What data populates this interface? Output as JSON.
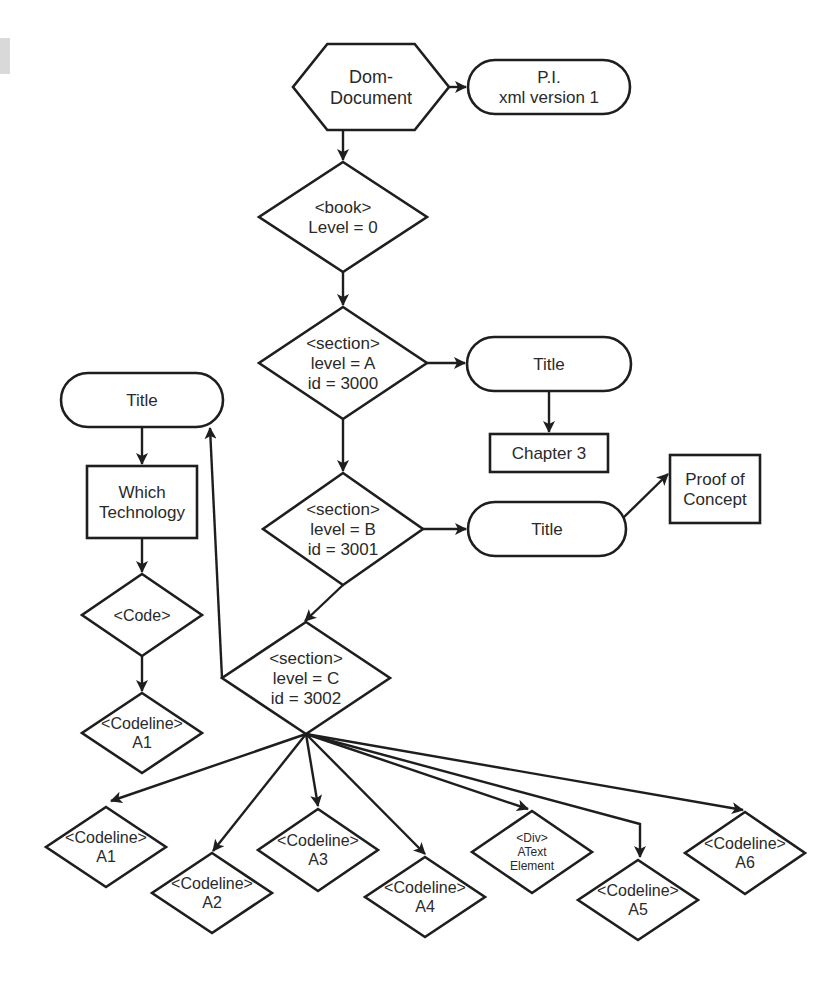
{
  "diagram": {
    "type": "flowchart",
    "colors": {
      "stroke": "#1e1e1e",
      "text": "#2a2a2a",
      "fill": "#ffffff",
      "margin_shade": "#d9d9d9"
    },
    "nodes": [
      {
        "id": "dom",
        "shape": "hexagon",
        "cx": 371,
        "cy": 87,
        "w": 156,
        "h": 86,
        "lines": [
          "Dom-",
          "Document"
        ],
        "size": 18
      },
      {
        "id": "pi",
        "shape": "terminator",
        "cx": 549,
        "cy": 87,
        "w": 162,
        "h": 54,
        "lines": [
          "P.I.",
          "xml version 1"
        ],
        "size": 17
      },
      {
        "id": "book",
        "shape": "diamond",
        "cx": 343,
        "cy": 217,
        "w": 168,
        "h": 110,
        "lines": [
          "<book>",
          "Level = 0"
        ],
        "size": 17
      },
      {
        "id": "secA",
        "shape": "diamond",
        "cx": 343,
        "cy": 363,
        "w": 168,
        "h": 112,
        "lines": [
          "<section>",
          "level = A",
          "id = 3000"
        ],
        "size": 17
      },
      {
        "id": "titleA",
        "shape": "terminator",
        "cx": 549,
        "cy": 364,
        "w": 164,
        "h": 54,
        "lines": [
          "Title"
        ],
        "size": 17
      },
      {
        "id": "chapter3",
        "shape": "rect",
        "cx": 549,
        "cy": 453,
        "w": 118,
        "h": 38,
        "lines": [
          "Chapter 3"
        ],
        "size": 17
      },
      {
        "id": "secB",
        "shape": "diamond",
        "cx": 343,
        "cy": 529,
        "w": 160,
        "h": 112,
        "lines": [
          "<section>",
          "level = B",
          "id = 3001"
        ],
        "size": 17
      },
      {
        "id": "titleB",
        "shape": "terminator",
        "cx": 547,
        "cy": 529,
        "w": 158,
        "h": 54,
        "lines": [
          "Title"
        ],
        "size": 17
      },
      {
        "id": "proof",
        "shape": "rect",
        "cx": 715,
        "cy": 489,
        "w": 90,
        "h": 68,
        "lines": [
          "Proof of",
          "Concept"
        ],
        "size": 17
      },
      {
        "id": "secC",
        "shape": "diamond",
        "cx": 306,
        "cy": 678,
        "w": 168,
        "h": 112,
        "lines": [
          "<section>",
          "level = C",
          "id = 3002"
        ],
        "size": 17
      },
      {
        "id": "titleL",
        "shape": "terminator",
        "cx": 142,
        "cy": 400,
        "w": 162,
        "h": 54,
        "lines": [
          "Title"
        ],
        "size": 17
      },
      {
        "id": "which",
        "shape": "rect",
        "cx": 142,
        "cy": 502,
        "w": 110,
        "h": 72,
        "lines": [
          "Which",
          "Technology"
        ],
        "size": 17
      },
      {
        "id": "code",
        "shape": "diamond",
        "cx": 142,
        "cy": 615,
        "w": 120,
        "h": 82,
        "lines": [
          "<Code>"
        ],
        "size": 16
      },
      {
        "id": "cl_left",
        "shape": "diamond",
        "cx": 142,
        "cy": 733,
        "w": 120,
        "h": 80,
        "lines": [
          "<Codeline>",
          "A1"
        ],
        "size": 16
      },
      {
        "id": "cl_a1",
        "shape": "diamond",
        "cx": 106,
        "cy": 847,
        "w": 120,
        "h": 80,
        "lines": [
          "<Codeline>",
          "A1"
        ],
        "size": 16
      },
      {
        "id": "cl_a2",
        "shape": "diamond",
        "cx": 212,
        "cy": 893,
        "w": 120,
        "h": 80,
        "lines": [
          "<Codeline>",
          "A2"
        ],
        "size": 16
      },
      {
        "id": "cl_a3",
        "shape": "diamond",
        "cx": 318,
        "cy": 850,
        "w": 120,
        "h": 82,
        "lines": [
          "<Codeline>",
          "A3"
        ],
        "size": 16
      },
      {
        "id": "cl_a4",
        "shape": "diamond",
        "cx": 425,
        "cy": 897,
        "w": 120,
        "h": 80,
        "lines": [
          "<Codeline>",
          "A4"
        ],
        "size": 16
      },
      {
        "id": "div",
        "shape": "diamond",
        "cx": 532,
        "cy": 852,
        "w": 120,
        "h": 82,
        "lines": [
          "<Div>",
          "AText",
          "Element"
        ],
        "size": 12
      },
      {
        "id": "cl_a5",
        "shape": "diamond",
        "cx": 638,
        "cy": 900,
        "w": 120,
        "h": 80,
        "lines": [
          "<Codeline>",
          "A5"
        ],
        "size": 16
      },
      {
        "id": "cl_a6",
        "shape": "diamond",
        "cx": 745,
        "cy": 853,
        "w": 120,
        "h": 82,
        "lines": [
          "<Codeline>",
          "A6"
        ],
        "size": 16
      }
    ],
    "edges": [
      {
        "from": "dom",
        "to": "pi",
        "points": [
          [
            449,
            87
          ],
          [
            466,
            87
          ]
        ]
      },
      {
        "from": "dom",
        "to": "book",
        "points": [
          [
            343,
            130
          ],
          [
            343,
            160
          ]
        ]
      },
      {
        "from": "book",
        "to": "secA",
        "points": [
          [
            343,
            272
          ],
          [
            343,
            305
          ]
        ]
      },
      {
        "from": "secA",
        "to": "titleA",
        "points": [
          [
            427,
            363
          ],
          [
            465,
            363
          ]
        ]
      },
      {
        "from": "titleA",
        "to": "chapter3",
        "points": [
          [
            549,
            391
          ],
          [
            549,
            432
          ]
        ]
      },
      {
        "from": "secA",
        "to": "secB",
        "points": [
          [
            343,
            419
          ],
          [
            343,
            471
          ]
        ]
      },
      {
        "from": "secB",
        "to": "titleB",
        "points": [
          [
            423,
            529
          ],
          [
            466,
            529
          ]
        ]
      },
      {
        "from": "titleB",
        "to": "proof",
        "points": [
          [
            622,
            519
          ],
          [
            668,
            474
          ]
        ]
      },
      {
        "from": "secB",
        "to": "secC",
        "points": [
          [
            343,
            585
          ],
          [
            305,
            621
          ]
        ]
      },
      {
        "from": "secC",
        "to": "titleL",
        "points": [
          [
            222,
            678
          ],
          [
            210,
            428
          ]
        ]
      },
      {
        "from": "titleL",
        "to": "which",
        "points": [
          [
            142,
            427
          ],
          [
            142,
            464
          ]
        ]
      },
      {
        "from": "which",
        "to": "code",
        "points": [
          [
            142,
            538
          ],
          [
            142,
            572
          ]
        ]
      },
      {
        "from": "code",
        "to": "cl_left",
        "points": [
          [
            142,
            656
          ],
          [
            142,
            691
          ]
        ]
      },
      {
        "from": "secC",
        "to": "cl_a1",
        "points": [
          [
            306,
            734
          ],
          [
            111,
            801
          ]
        ]
      },
      {
        "from": "secC",
        "to": "cl_a2",
        "points": [
          [
            306,
            734
          ],
          [
            213,
            851
          ]
        ]
      },
      {
        "from": "secC",
        "to": "cl_a3",
        "points": [
          [
            306,
            734
          ],
          [
            318,
            806
          ]
        ]
      },
      {
        "from": "secC",
        "to": "cl_a4",
        "points": [
          [
            306,
            734
          ],
          [
            425,
            854
          ]
        ]
      },
      {
        "from": "secC",
        "to": "div",
        "points": [
          [
            306,
            734
          ],
          [
            528,
            809
          ]
        ]
      },
      {
        "from": "secC",
        "to": "cl_a5",
        "points": [
          [
            306,
            734
          ],
          [
            640,
            824
          ],
          [
            640,
            857
          ]
        ]
      },
      {
        "from": "secC",
        "to": "cl_a6",
        "points": [
          [
            306,
            734
          ],
          [
            743,
            810
          ]
        ]
      }
    ]
  }
}
